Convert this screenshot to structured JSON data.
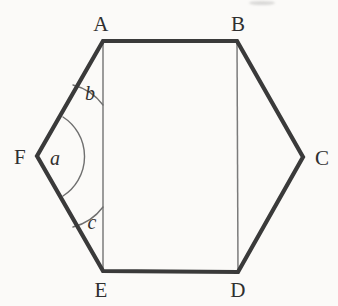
{
  "figure": {
    "kind": "geometry-diagram",
    "shape": "hexagon",
    "background_color": "#fbfaf8",
    "outline_color": "#3a3a3a",
    "outline_width": 4.2,
    "interior_line_color": "#7b7b7b",
    "interior_line_width": 1.5,
    "arc_color": "#6f6f6f",
    "arc_width": 1.4,
    "vertices": [
      {
        "name": "A",
        "x": 103,
        "y": 41,
        "label_x": 101,
        "label_y": 24
      },
      {
        "name": "B",
        "x": 237,
        "y": 41,
        "label_x": 238,
        "label_y": 24
      },
      {
        "name": "C",
        "x": 303,
        "y": 157,
        "label_x": 322,
        "label_y": 158
      },
      {
        "name": "D",
        "x": 238,
        "y": 272,
        "label_x": 238,
        "label_y": 290
      },
      {
        "name": "E",
        "x": 103,
        "y": 271,
        "label_x": 101,
        "label_y": 290
      },
      {
        "name": "F",
        "x": 37,
        "y": 156,
        "label_x": 20,
        "label_y": 157
      }
    ],
    "outline_path": "M 103 41 L 237 41 L 303 157 L 238 272 L 103 271 L 37 156 Z",
    "interior_lines": [
      {
        "name": "segment-AE",
        "from": "A",
        "to": "E",
        "x1": 103,
        "y1": 41,
        "x2": 103,
        "y2": 271
      },
      {
        "name": "segment-BD",
        "from": "B",
        "to": "D",
        "x1": 237,
        "y1": 41,
        "x2": 238,
        "y2": 272
      }
    ],
    "angles": [
      {
        "name": "a",
        "label": "a",
        "at_vertex": "F",
        "between": [
          "FA",
          "FE"
        ],
        "label_x": 55,
        "label_y": 158,
        "arc_path": "M 63 117 A 47 47 0 0 1 63 196"
      },
      {
        "name": "b",
        "label": "b",
        "at_vertex": "A",
        "between": [
          "AF",
          "AE"
        ],
        "label_x": 90,
        "label_y": 93,
        "arc_path": "M 73 85 A 54 54 0 0 1 103 105"
      },
      {
        "name": "c",
        "label": "c",
        "at_vertex": "E",
        "between": [
          "EA",
          "EF"
        ],
        "label_x": 92,
        "label_y": 222,
        "arc_path": "M 103 207 A 54 54 0 0 1 73 227"
      }
    ],
    "top_smudge": {
      "x": 249,
      "y": 1,
      "width": 26,
      "height": 4
    }
  }
}
